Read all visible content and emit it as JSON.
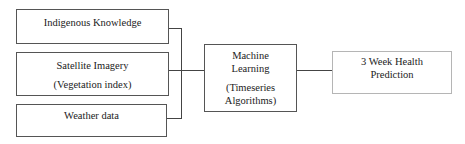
{
  "diagram": {
    "inputs": [
      {
        "lines": [
          "Indigenous Knowledge"
        ]
      },
      {
        "lines": [
          "Satellite Imagery",
          "(Vegetation index)"
        ]
      },
      {
        "lines": [
          "Weather data"
        ]
      }
    ],
    "model": {
      "lines": [
        "Machine",
        "Learning",
        "(Timeseries",
        "Algorithms)"
      ]
    },
    "output": {
      "lines": [
        "3 Week Health",
        "Prediction"
      ]
    },
    "colors": {
      "border": "#555555",
      "output_border": "#b5b5b5",
      "connector": "#444444"
    }
  }
}
